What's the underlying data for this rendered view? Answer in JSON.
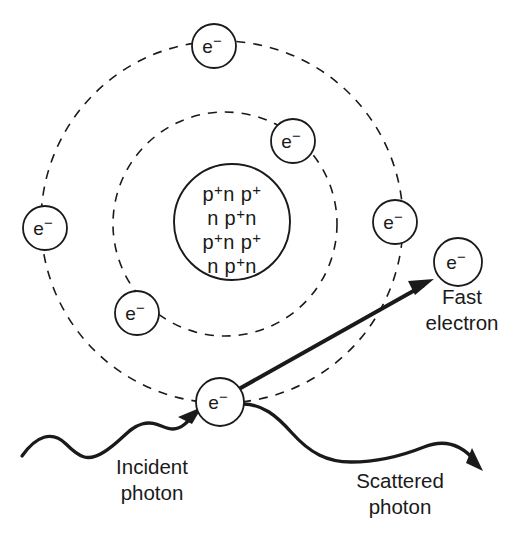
{
  "diagram": {
    "background_color": "#ffffff",
    "ink_color": "#1a1a1a"
  },
  "nucleus": {
    "name": "atomic-nucleus",
    "center_x": 232,
    "center_y": 222,
    "radius": 58,
    "rows": [
      {
        "parts": [
          {
            "t": "p",
            "sup": "+"
          },
          {
            "t": "n",
            "sup": ""
          },
          {
            "t": " p",
            "sup": "+"
          }
        ]
      },
      {
        "parts": [
          {
            "t": "n ",
            "sup": ""
          },
          {
            "t": "p",
            "sup": "+"
          },
          {
            "t": "n",
            "sup": ""
          }
        ]
      },
      {
        "parts": [
          {
            "t": "p",
            "sup": "+"
          },
          {
            "t": "n",
            "sup": ""
          },
          {
            "t": " p",
            "sup": "+"
          }
        ]
      },
      {
        "parts": [
          {
            "t": "n ",
            "sup": ""
          },
          {
            "t": "p",
            "sup": "+"
          },
          {
            "t": "n",
            "sup": ""
          }
        ]
      }
    ],
    "row_labels": [
      "p+n p+",
      "n p+n",
      "p+n p+",
      "n p+n"
    ]
  },
  "orbits": [
    {
      "name": "inner-orbit",
      "center_x": 225,
      "center_y": 224,
      "radius": 112,
      "style": "dashed"
    },
    {
      "name": "outer-orbit",
      "center_x": 222,
      "center_y": 222,
      "radius": 181,
      "style": "dashed"
    }
  ],
  "electron_symbol": {
    "base": "e",
    "superscript": "−"
  },
  "electrons": [
    {
      "name": "electron-outer-top",
      "cx": 214,
      "cy": 46,
      "r": 22,
      "orbit": "outer-orbit"
    },
    {
      "name": "electron-outer-left",
      "cx": 45,
      "cy": 228,
      "r": 22,
      "orbit": "outer-orbit"
    },
    {
      "name": "electron-outer-right",
      "cx": 395,
      "cy": 222,
      "r": 22,
      "orbit": "outer-orbit"
    },
    {
      "name": "electron-inner-upper-right",
      "cx": 293,
      "cy": 141,
      "r": 22,
      "orbit": "inner-orbit"
    },
    {
      "name": "electron-inner-lower-left",
      "cx": 137,
      "cy": 313,
      "r": 22,
      "orbit": "inner-orbit"
    },
    {
      "name": "electron-interaction",
      "cx": 220,
      "cy": 402,
      "r": 24,
      "orbit": "outer-orbit"
    },
    {
      "name": "electron-fast-ejected",
      "cx": 458,
      "cy": 262,
      "r": 24,
      "orbit": "none"
    }
  ],
  "labels": {
    "incident_photon": {
      "line1": "Incident",
      "line2": "photon",
      "x": 152,
      "y": 470
    },
    "scattered_photon": {
      "line1": "Scattered",
      "line2": "photon",
      "x": 400,
      "y": 484
    },
    "fast_electron": {
      "line1": "Fast",
      "line2": "electron",
      "x": 462,
      "y": 308
    }
  },
  "paths": {
    "incident_photon_wave": "M 22 456 C 36 436, 52 430, 66 444 C 80 458, 88 462, 104 452 C 122 441, 128 428, 142 424 C 156 420, 162 428, 172 428 C 184 428, 190 418, 198 410",
    "incident_arrow_tip": {
      "x": 200,
      "y": 409,
      "angle": -40
    },
    "scattered_photon_wave": "M 244 404 C 262 404, 276 414, 292 432 C 310 452, 326 462, 350 462 C 380 462, 404 456, 424 448 C 444 440, 460 444, 476 462",
    "scattered_arrow_tip": {
      "x": 482,
      "y": 470,
      "angle": 52
    },
    "fast_electron_vector": {
      "x1": 228,
      "y1": 394,
      "x2": 428,
      "y2": 282
    }
  }
}
